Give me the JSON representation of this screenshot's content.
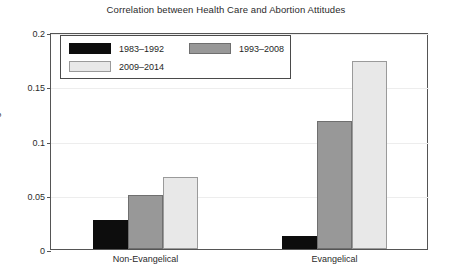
{
  "chart_data": {
    "type": "bar",
    "title": "Correlation between Health Care and Abortion Attitudes",
    "xlabel": "",
    "ylabel": "Average Correlation",
    "categories": [
      "Non-Evangelical",
      "Evangelical"
    ],
    "series": [
      {
        "name": "1983–1992",
        "color": "#0d0d0d",
        "values": [
          0.027,
          0.012
        ]
      },
      {
        "name": "1993–2008",
        "color": "#989898",
        "values": [
          0.05,
          0.118
        ]
      },
      {
        "name": "2009–2014",
        "color": "#e8e8e8",
        "values": [
          0.066,
          0.173
        ]
      }
    ],
    "ylim": [
      0,
      0.2
    ],
    "yticks": [
      0,
      0.05,
      0.1,
      0.15,
      0.2
    ],
    "ytick_labels": [
      "0",
      "0.05",
      "0.1",
      "0.15",
      "0.2"
    ],
    "grid": true,
    "legend_position": "top-left"
  }
}
